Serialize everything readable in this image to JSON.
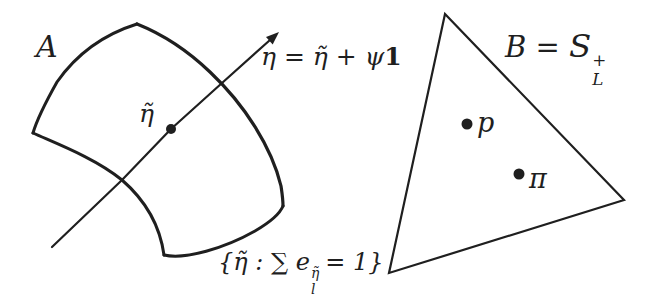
{
  "colors": {
    "ink": "#1f1f1f",
    "background": "#ffffff"
  },
  "region_a": {
    "label": "A",
    "point": {
      "label": "η̃"
    },
    "arrow_label": {
      "main": "η = η̃ + ψ",
      "bold_one": "1"
    },
    "constraint": {
      "prefix": "{η̃ : ∑ e",
      "sup": "η̃",
      "sub": "l",
      "suffix": "= 1}"
    }
  },
  "region_b": {
    "label": {
      "prefix": "B = ",
      "set_symbol": "S",
      "sup": "+",
      "sub": "L"
    },
    "points": [
      {
        "label": "p"
      },
      {
        "label": "π"
      }
    ]
  }
}
